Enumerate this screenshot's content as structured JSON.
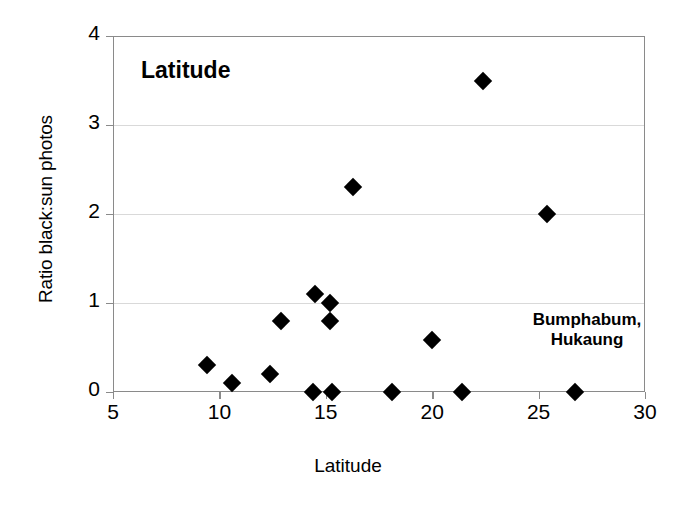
{
  "chart_data": {
    "type": "scatter",
    "title": "Latitude",
    "xlabel": "Latitude",
    "ylabel": "Ratio black:sun photos",
    "xlim": [
      5,
      30
    ],
    "ylim": [
      0,
      4
    ],
    "xticks": [
      5,
      10,
      15,
      20,
      25,
      30
    ],
    "yticks": [
      0,
      1,
      2,
      3,
      4
    ],
    "grid": "horizontal",
    "legend": "none",
    "marker": "filled-diamond",
    "marker_color": "#000000",
    "annotations": [
      {
        "text": "Bumphabum,\nHukaung",
        "line1": "Bumphabum,",
        "line2": "Hukaung",
        "x": 26.7,
        "y": 0.65
      }
    ],
    "points": [
      {
        "x": 9.4,
        "y": 0.3
      },
      {
        "x": 10.6,
        "y": 0.1
      },
      {
        "x": 12.4,
        "y": 0.2
      },
      {
        "x": 12.9,
        "y": 0.8
      },
      {
        "x": 14.4,
        "y": 0.0
      },
      {
        "x": 14.5,
        "y": 1.1
      },
      {
        "x": 15.2,
        "y": 1.0
      },
      {
        "x": 15.2,
        "y": 0.8
      },
      {
        "x": 15.3,
        "y": 0.0
      },
      {
        "x": 16.3,
        "y": 2.3
      },
      {
        "x": 18.1,
        "y": 0.0
      },
      {
        "x": 20.0,
        "y": 0.58
      },
      {
        "x": 21.4,
        "y": 0.0
      },
      {
        "x": 22.4,
        "y": 3.5
      },
      {
        "x": 25.4,
        "y": 2.0
      },
      {
        "x": 26.7,
        "y": 0.0
      }
    ]
  }
}
